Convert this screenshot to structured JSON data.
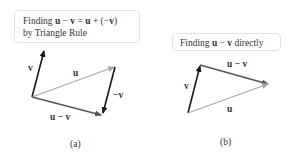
{
  "panel_a": {
    "caption_line1_prefix": "Finding ",
    "caption_line1_u": "u",
    "caption_line1_minus": " − ",
    "caption_line1_v": "v",
    "caption_line1_eq": " = ",
    "caption_line1_u2": "u",
    "caption_line1_plus": " + (−",
    "caption_line1_v2": "v",
    "caption_line1_close": ")",
    "caption_line2": "by Triangle Rule",
    "label": "(a)",
    "vectors": {
      "v": "v",
      "u": "u",
      "neg_v": "−v",
      "u_minus_v": "u − v"
    }
  },
  "panel_b": {
    "caption_prefix": "Finding ",
    "caption_u": "u",
    "caption_minus": " − ",
    "caption_v": "v",
    "caption_suffix": " directly",
    "label": "(b)",
    "vectors": {
      "v": "v",
      "u": "u",
      "u_minus_v": "u − v"
    }
  },
  "colors": {
    "dark_vector": "#1a1a1a",
    "gray_vector": "#a8a8a8",
    "medium_vector": "#555555"
  }
}
